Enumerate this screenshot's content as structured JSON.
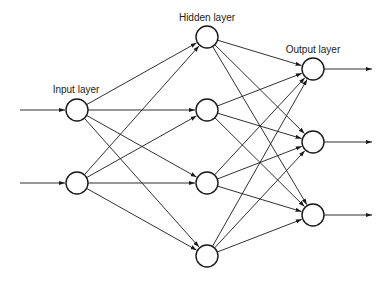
{
  "diagram": {
    "title": "",
    "colors": {
      "stroke": "#1a1a1a",
      "text": "#222222",
      "background": "#ffffff"
    },
    "layers": [
      {
        "id": "input",
        "label": "Input layer",
        "label_pos": [
          76,
          93
        ],
        "x": 77,
        "ys": [
          110,
          183
        ]
      },
      {
        "id": "hidden",
        "label": "Hidden layer",
        "label_pos": [
          207,
          21
        ],
        "x": 207,
        "ys": [
          37,
          110,
          183,
          256
        ]
      },
      {
        "id": "output",
        "label": "Output layer",
        "label_pos": [
          313,
          53
        ],
        "x": 313,
        "ys": [
          69,
          142,
          215
        ]
      }
    ],
    "node_radius": 11,
    "inputs": {
      "x_start": 20,
      "description": "incoming arrows into each input node"
    },
    "outputs": {
      "x_end": 372,
      "description": "outgoing arrows from each output node"
    },
    "connections": "fully connected: input→hidden, hidden→output"
  }
}
